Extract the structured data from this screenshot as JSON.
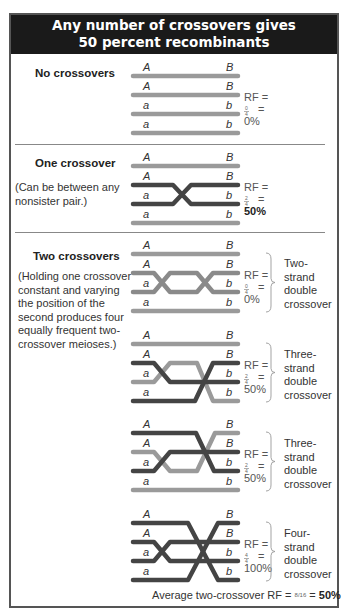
{
  "header": {
    "title_line1": "Any number of crossovers gives",
    "title_line2": "50 percent recombinants"
  },
  "colors": {
    "header_bg": "#1a1a1a",
    "light_strand": "#9a9a9a",
    "dark_strand": "#444444",
    "mid_strand": "#8a8a8a"
  },
  "sections": [
    {
      "id": "none",
      "title": "No crossovers",
      "note": "",
      "rf_label": "RF =",
      "fraction": "0/4",
      "eq": "=",
      "percent": "0%"
    },
    {
      "id": "one",
      "title": "One crossover",
      "note_lines": [
        "(Can be between any",
        "nonsister pair.)"
      ],
      "rf_label": "RF =",
      "fraction": "2/4",
      "eq": "=",
      "percent": "50%"
    },
    {
      "id": "two",
      "title": "Two crossovers",
      "note_lines": [
        "(Holding one crossover",
        "constant and varying",
        "the position of the",
        "second produces four",
        "equally frequent two-",
        "crossover meioses.)"
      ]
    }
  ],
  "two_crossover_cases": [
    {
      "rf_label": "RF =",
      "fraction": "0/4",
      "eq": "=",
      "percent": "0%",
      "type_lines": [
        "Two-",
        "strand",
        "double",
        "crossover"
      ]
    },
    {
      "rf_label": "RF =",
      "fraction": "2/4",
      "eq": "=",
      "percent": "50%",
      "type_lines": [
        "Three-",
        "strand",
        "double",
        "crossover"
      ]
    },
    {
      "rf_label": "RF =",
      "fraction": "2/4",
      "eq": "=",
      "percent": "50%",
      "type_lines": [
        "Three-",
        "strand",
        "double",
        "crossover"
      ]
    },
    {
      "rf_label": "RF =",
      "fraction": "4/4",
      "eq": "=",
      "percent": "100%",
      "type_lines": [
        "Four-",
        "strand",
        "double",
        "crossover"
      ]
    }
  ],
  "locus_labels": {
    "A": "A",
    "B": "B",
    "a": "a",
    "b": "b"
  },
  "average": {
    "label": "Average two-crossover RF =",
    "fraction": "8/16",
    "eq": "=",
    "percent": "50%"
  }
}
